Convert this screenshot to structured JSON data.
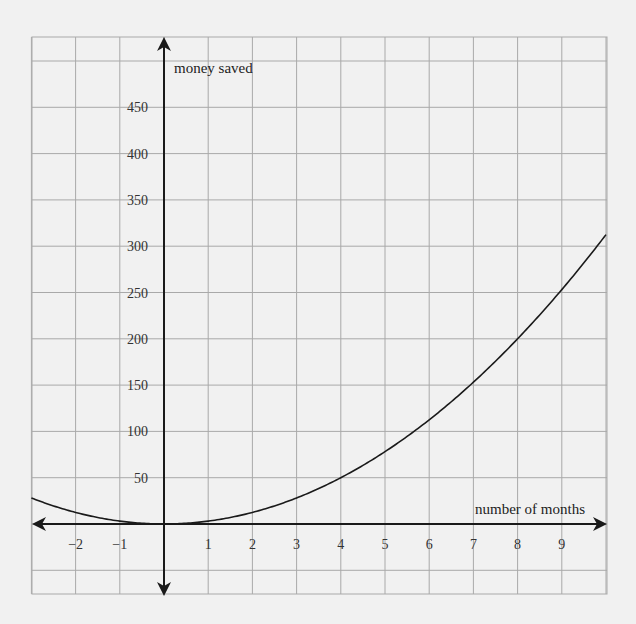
{
  "chart_data": {
    "type": "line",
    "title": "",
    "xlabel": "number of months",
    "ylabel": "money saved",
    "xlim": [
      -3,
      10
    ],
    "ylim": [
      -75,
      525
    ],
    "grid": true,
    "legend": null,
    "x_ticks": [
      -2,
      -1,
      1,
      2,
      3,
      4,
      5,
      6,
      7,
      8,
      9
    ],
    "x_tick_labels": [
      "−2",
      "−1",
      "1",
      "2",
      "3",
      "4",
      "5",
      "6",
      "7",
      "8",
      "9"
    ],
    "y_ticks": [
      50,
      100,
      150,
      200,
      250,
      300,
      350,
      400,
      450
    ],
    "y_tick_labels": [
      "50",
      "100",
      "150",
      "200",
      "250",
      "300",
      "350",
      "400",
      "450"
    ],
    "series": [
      {
        "name": "money saved",
        "function": "y = 3.125x^2",
        "x": [
          -3,
          -2,
          -1,
          0,
          1,
          2,
          3,
          4,
          5,
          6,
          7,
          8,
          9,
          10
        ],
        "values": [
          28,
          12.5,
          3.1,
          0,
          3.1,
          12.5,
          28,
          50,
          78,
          112.5,
          153,
          200,
          253,
          312.5
        ]
      }
    ],
    "colors": {
      "background": "#f1f1f1",
      "grid": "#a9a9a9",
      "axis": "#1a1a1a",
      "curve": "#1a1a1a"
    }
  }
}
